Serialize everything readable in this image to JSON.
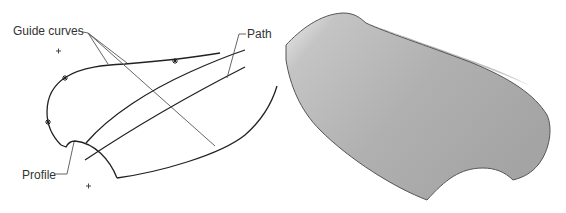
{
  "figure": {
    "left_panel": {
      "description": "Wireframe with profile, path and guide curves",
      "labels": {
        "guide_curves": "Guide curves",
        "path": "Path",
        "profile": "Profile"
      },
      "markers": {
        "guide_point": "*",
        "origin_point": "+"
      }
    },
    "right_panel": {
      "description": "Resulting swept surface",
      "colors": {
        "surface_light": "#e8e8e8",
        "surface_mid": "#b8b8b8",
        "surface_dark": "#9a9a9a",
        "edge": "#555555"
      }
    },
    "colors": {
      "curve": "#222222",
      "leader": "#555555",
      "text": "#333333",
      "background": "#ffffff"
    }
  }
}
